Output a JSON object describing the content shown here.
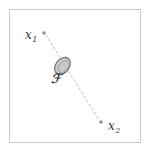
{
  "figure": {
    "background_color": "#ffffff",
    "frame": {
      "stroke_color": "#c9c9c9",
      "stroke_width": 1,
      "x": 9,
      "y": 9,
      "width": 131,
      "height": 133
    },
    "points": [
      {
        "id": "x1",
        "label_var": "x",
        "label_sub": "1",
        "marker_x": 44,
        "marker_y": 33,
        "marker_radius": 1.7,
        "marker_color": "#8e8e8e",
        "label_x": 25,
        "label_y": 26
      },
      {
        "id": "x2",
        "label_var": "x",
        "label_sub": "2",
        "marker_x": 101,
        "marker_y": 122,
        "marker_radius": 1.7,
        "marker_color": "#8e8e8e",
        "label_x": 108,
        "label_y": 117
      }
    ],
    "connector": {
      "id": "dashed-path",
      "from_x": 46,
      "from_y": 35,
      "to_x": 99,
      "to_y": 120,
      "stroke_color": "#cccccc",
      "stroke_width": 1.1,
      "dash_pattern": "2.2 2.6",
      "style": "dashed"
    },
    "region": {
      "id": "F",
      "label": "ℱ",
      "label_x": 51,
      "label_y": 72,
      "label_color": "#434343",
      "center_x": 62.5,
      "center_y": 66,
      "radius_x": 9.5,
      "radius_y": 6.8,
      "rotation_deg": -52,
      "fill_color": "#b6b6b6",
      "fill_opacity": 0.72,
      "stroke_color": "#6f6f6f",
      "stroke_width": 1.1,
      "inner_stroke_color": "#8d8d8d",
      "inner_stroke_width": 0.8,
      "inner_radius_x": 6.6,
      "inner_radius_y": 4.4
    }
  }
}
